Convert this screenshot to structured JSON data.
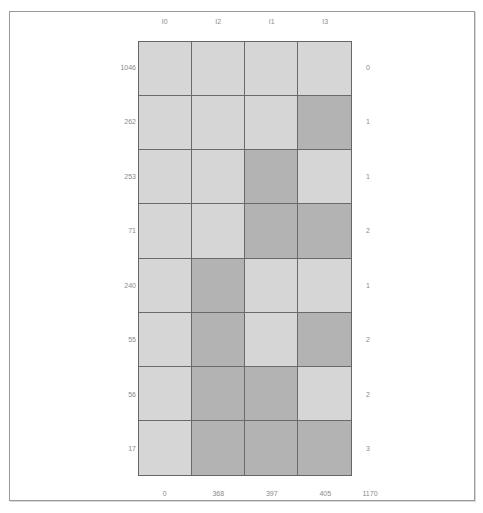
{
  "colors": {
    "light_cell": "#d6d6d6",
    "dark_cell": "#b3b3b3",
    "grid_line": "#6a6a6a",
    "frame_border": "#9a9a9a",
    "label_text": "#8a8a8a"
  },
  "columns": {
    "headers": [
      "I0",
      "I2",
      "I1",
      "I3"
    ],
    "footers": [
      "0",
      "368",
      "397",
      "405"
    ],
    "footer_total": "1170"
  },
  "rows": [
    {
      "left": "1046",
      "right": "0",
      "cells": [
        0,
        0,
        0,
        0
      ]
    },
    {
      "left": "262",
      "right": "1",
      "cells": [
        0,
        0,
        0,
        1
      ]
    },
    {
      "left": "253",
      "right": "1",
      "cells": [
        0,
        0,
        1,
        0
      ]
    },
    {
      "left": "71",
      "right": "2",
      "cells": [
        0,
        0,
        1,
        1
      ]
    },
    {
      "left": "240",
      "right": "1",
      "cells": [
        0,
        1,
        0,
        0
      ]
    },
    {
      "left": "55",
      "right": "2",
      "cells": [
        0,
        1,
        0,
        1
      ]
    },
    {
      "left": "56",
      "right": "2",
      "cells": [
        0,
        1,
        1,
        0
      ]
    },
    {
      "left": "17",
      "right": "3",
      "cells": [
        0,
        1,
        1,
        1
      ]
    }
  ]
}
